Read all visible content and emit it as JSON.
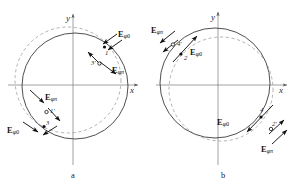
{
  "figure": {
    "width": 302,
    "height": 186,
    "background": "#ffffff",
    "stroke_solid": "#3c3c3c",
    "stroke_dashed": "#8c8c8c",
    "axis_color": "#6e6e6e",
    "arrow_color": "#111111"
  },
  "panels": [
    {
      "id": "a",
      "caption": "a",
      "axes": {
        "x_label": "x",
        "y_label": "y"
      },
      "field_labels": [
        {
          "key": "a-e-phi0-top",
          "base": "E",
          "sub_phi": "φ",
          "sub_mode": "0",
          "text": "Eφ0"
        },
        {
          "key": "a-e-phipi-top",
          "base": "E",
          "sub_phi": "φ",
          "sub_mode": "π",
          "text": "Eφπ"
        },
        {
          "key": "a-e-phipi-bot",
          "base": "E",
          "sub_phi": "φ",
          "sub_mode": "π",
          "text": "Eφπ"
        },
        {
          "key": "a-e-phi0-bot",
          "base": "E",
          "sub_phi": "φ",
          "sub_mode": "0",
          "text": "Eφ0"
        }
      ],
      "point_labels": [
        {
          "key": "a-pt-1",
          "text": "1",
          "marker": "filled"
        },
        {
          "key": "a-pt-3p",
          "text": "3′",
          "marker": "open"
        },
        {
          "key": "a-pt-1p",
          "text": "1′",
          "marker": "open"
        },
        {
          "key": "a-pt-3",
          "text": "3",
          "marker": "filled"
        }
      ]
    },
    {
      "id": "b",
      "caption": "b",
      "axes": {
        "x_label": "x",
        "y_label": "y"
      },
      "field_labels": [
        {
          "key": "b-e-phipi-top",
          "base": "E",
          "sub_phi": "φ",
          "sub_mode": "π",
          "text": "Eφπ"
        },
        {
          "key": "b-e-phi0-top",
          "base": "E",
          "sub_phi": "φ",
          "sub_mode": "0",
          "text": "Eφ0"
        },
        {
          "key": "b-e-phi0-bot",
          "base": "E",
          "sub_phi": "φ",
          "sub_mode": "0",
          "text": "Eφ0"
        },
        {
          "key": "b-e-phipi-bot",
          "base": "E",
          "sub_phi": "φ",
          "sub_mode": "π",
          "text": "Eφπ"
        }
      ],
      "point_labels": [
        {
          "key": "b-pt-4p",
          "text": "4′",
          "marker": "open"
        },
        {
          "key": "b-pt-2",
          "text": "2",
          "marker": "filled"
        },
        {
          "key": "b-pt-4",
          "text": "4",
          "marker": "filled"
        },
        {
          "key": "b-pt-2p",
          "text": "2′",
          "marker": "open"
        }
      ]
    }
  ]
}
